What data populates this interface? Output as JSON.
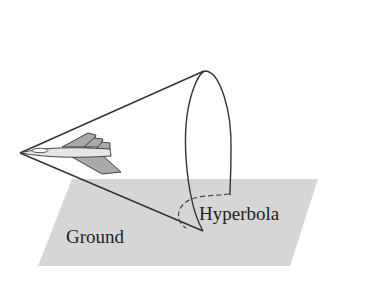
{
  "diagram": {
    "type": "cone-plane-intersection",
    "labels": {
      "ground": "Ground",
      "hyperbola": "Hyperbola"
    },
    "colors": {
      "ground_fill": "#d4d4d4",
      "line": "#333333",
      "plane_body": "#a8a8a8",
      "plane_fuselage": "#e8e8e8"
    }
  }
}
